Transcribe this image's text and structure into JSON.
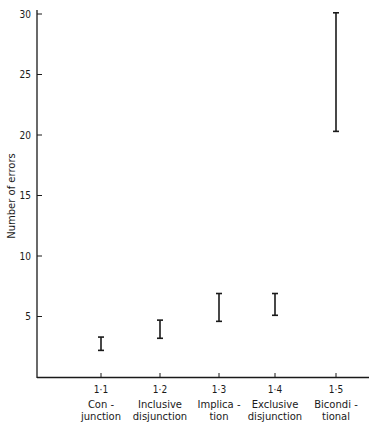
{
  "chart_data": {
    "type": "errorbar",
    "title": "",
    "xlabel": "",
    "ylabel": "Number of errors",
    "ylim": [
      0,
      30
    ],
    "yticks": [
      5,
      10,
      15,
      20,
      25,
      30
    ],
    "grid": false,
    "legend": null,
    "categories": [
      {
        "code": "1·1",
        "label_lines": [
          "Con -",
          "junction"
        ]
      },
      {
        "code": "1·2",
        "label_lines": [
          "Inclusive",
          "disjunction"
        ]
      },
      {
        "code": "1·3",
        "label_lines": [
          "Implica -",
          "tion"
        ]
      },
      {
        "code": "1·4",
        "label_lines": [
          "Exclusive",
          "disjunction"
        ]
      },
      {
        "code": "1·5",
        "label_lines": [
          "Bicondi -",
          "tional"
        ]
      }
    ],
    "series": [
      {
        "name": "Number of errors (range)",
        "low": [
          2.2,
          3.2,
          4.6,
          5.1,
          20.3
        ],
        "high": [
          3.3,
          4.7,
          6.9,
          6.9,
          30.1
        ]
      }
    ]
  },
  "axis": {
    "y_title": "Number of errors",
    "y_tick_labels": [
      "5",
      "10",
      "15",
      "20",
      "25",
      "30"
    ]
  }
}
